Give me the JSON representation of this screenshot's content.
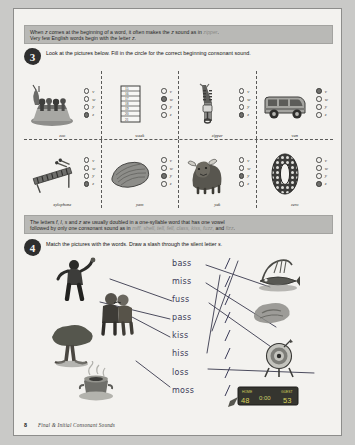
{
  "page": {
    "footer_page_number": "8",
    "footer_title": "Final & Initial Consonant Sounds"
  },
  "band1": {
    "line1_a": "When ",
    "line1_z": "z",
    "line1_b": " comes at the beginning of a word, it often makes the ",
    "line1_z2": "z",
    "line1_c": " sound as in ",
    "line1_word": "zipper",
    "line1_d": ".",
    "line2_a": "Very few English words begin with the letter ",
    "line2_z": "z",
    "line2_b": "."
  },
  "task3": {
    "number": "3",
    "text": "Look at the pictures below. Fill in the circle for the correct beginning consonant sound."
  },
  "band2": {
    "line1_a": "The letters ",
    "line1_f": "f",
    "line1_sep1": ", ",
    "line1_l": "l",
    "line1_sep2": ", ",
    "line1_s": "s",
    "line1_and": " and ",
    "line1_z": "z",
    "line1_b": " are usually doubled in a one-syllable word that has one vowel",
    "line2_a": "followed by only one consonant sound as in ",
    "line2_words": "miff, shell, tell, fell, class, kiss, fuzz,",
    "line2_and": " and ",
    "line2_last": "fizz",
    "line2_end": "."
  },
  "task4": {
    "number": "4",
    "text_a": "Match the pictures with the words. Draw a slash through the silent letter ",
    "text_s": "s",
    "text_b": "."
  },
  "consonant_options": [
    "v",
    "w",
    "y",
    "z"
  ],
  "grid": {
    "row1": [
      {
        "caption": "zoo",
        "picture": "zoo-animals-icon",
        "answer": "z"
      },
      {
        "caption": "week",
        "picture": "calendar-icon",
        "answer": "w"
      },
      {
        "caption": "zipper",
        "picture": "zipper-icon",
        "answer": "z"
      },
      {
        "caption": "van",
        "picture": "van-icon",
        "answer": "v"
      }
    ],
    "row2": [
      {
        "caption": "xylophone",
        "picture": "xylophone-icon",
        "answer": "z"
      },
      {
        "caption": "yam",
        "picture": "yam-icon",
        "answer": "y"
      },
      {
        "caption": "yak",
        "picture": "yak-icon",
        "answer": "y"
      },
      {
        "caption": "zero",
        "picture": "zero-icon",
        "answer": "z"
      }
    ]
  },
  "calendar_rows": [
    "15",
    "16",
    "17",
    "18",
    "19",
    "20",
    "21"
  ],
  "zero_digit": "0",
  "match_words": [
    "bass",
    "miss",
    "fuss",
    "pass",
    "kiss",
    "hiss",
    "loss",
    "moss"
  ],
  "match_pictures_left": [
    "person-throwing-icon",
    "couple-kissing-icon",
    "mossy-tree-icon",
    "steaming-pot-icon"
  ],
  "match_pictures_right": [
    "bass-fish-icon",
    "smudge-icon",
    "dart-target-icon",
    "scoreboard-icon"
  ],
  "scoreboard": {
    "home_label": "HOME",
    "home_score": "48",
    "time": "0:00",
    "guest_label": "GUEST",
    "guest_score": "53"
  },
  "colors": {
    "paper": "#f3f2ef",
    "band": "#b9b9b6",
    "ink": "#2e2e2e",
    "handwriting": "#3b3b58",
    "bubble_filled": "#6f6f6c"
  }
}
